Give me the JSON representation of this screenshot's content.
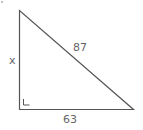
{
  "figure": {
    "type": "right-triangle",
    "labels": {
      "vertical_leg": "x",
      "hypotenuse": "87",
      "horizontal_leg": "63"
    },
    "right_angle_marker": "bottom-left",
    "colors": {
      "stroke": "#555555",
      "text": "#666666",
      "background": "#ffffff"
    }
  }
}
